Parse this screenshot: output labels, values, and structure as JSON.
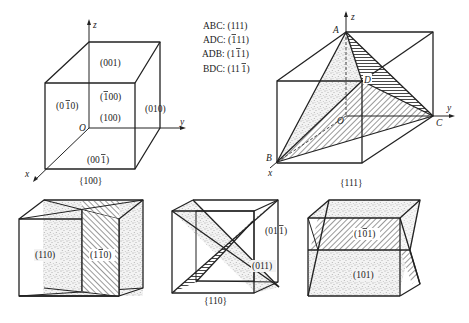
{
  "figure": {
    "panels": [
      {
        "id": "cube-100",
        "caption": "{100}",
        "axes": {
          "x": "x",
          "y": "y",
          "z": "z",
          "origin": "O"
        },
        "faces": [
          {
            "label": "(001)",
            "index": "001",
            "bars": []
          },
          {
            "label": "(0̅1̅0)",
            "index": "010",
            "bars": [
              1
            ]
          },
          {
            "label": "(̅1̅00)",
            "index": "100",
            "bars": [
              0
            ]
          },
          {
            "label": "(100)",
            "index": "100",
            "bars": []
          },
          {
            "label": "(010)",
            "index": "010",
            "bars": []
          },
          {
            "label": "(001̅)",
            "index": "001",
            "bars": [
              2
            ]
          }
        ]
      },
      {
        "id": "tetra-111",
        "caption": "{111}",
        "axes": {
          "x": "x",
          "y": "y",
          "z": "z",
          "origin": "O"
        },
        "vertices": [
          "A",
          "B",
          "C",
          "D"
        ],
        "legend": [
          {
            "plane": "ABC",
            "index": "111",
            "bars": []
          },
          {
            "plane": "ADC",
            "index": "111",
            "bars": [
              0
            ]
          },
          {
            "plane": "ADB",
            "index": "111",
            "bars": [
              1
            ]
          },
          {
            "plane": "BDC",
            "index": "111",
            "bars": [
              2
            ]
          }
        ]
      },
      {
        "id": "prism-110",
        "caption": "",
        "faces": [
          {
            "index": "110",
            "bars": [],
            "fill": "stipple"
          },
          {
            "index": "110",
            "bars": [
              0
            ],
            "fill": "hatch"
          }
        ]
      },
      {
        "id": "cross-011",
        "caption": "{110}",
        "faces": [
          {
            "index": "011",
            "bars": [
              2
            ],
            "fill": "hatch"
          },
          {
            "index": "011",
            "bars": [],
            "fill": "stipple"
          }
        ]
      },
      {
        "id": "prism-101",
        "caption": "",
        "faces": [
          {
            "index": "101",
            "bars": [
              1
            ],
            "fill": "hatch"
          },
          {
            "index": "101",
            "bars": [],
            "fill": "stipple"
          }
        ]
      }
    ]
  }
}
